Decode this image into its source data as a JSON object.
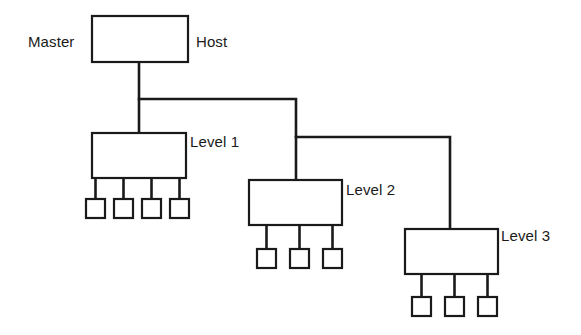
{
  "diagram": {
    "background_color": "#ffffff",
    "line_color": "#1a1a1a",
    "box_fill": "#ffffff",
    "labels": {
      "master": "Master",
      "host": "Host",
      "level1": "Level 1",
      "level2": "Level 2",
      "level3": "Level 3"
    },
    "nodes": [
      {
        "id": "master-host",
        "name": "master-host-box",
        "x": 92,
        "y": 16,
        "width": 96,
        "height": 46,
        "leaf_count": 0
      },
      {
        "id": "level1",
        "name": "level-1-box",
        "x": 92,
        "y": 133,
        "width": 94,
        "height": 45,
        "leaf_count": 4
      },
      {
        "id": "level2",
        "name": "level-2-box",
        "x": 249,
        "y": 180,
        "width": 93,
        "height": 45,
        "leaf_count": 3
      },
      {
        "id": "level3",
        "name": "level-3-box",
        "x": 405,
        "y": 229,
        "width": 93,
        "height": 45,
        "leaf_count": 3
      }
    ],
    "leaf_nodes": [
      {
        "parent": "level1",
        "x": 86,
        "y": 199,
        "size": 19
      },
      {
        "parent": "level1",
        "x": 114,
        "y": 199,
        "size": 19
      },
      {
        "parent": "level1",
        "x": 142,
        "y": 199,
        "size": 19
      },
      {
        "parent": "level1",
        "x": 170,
        "y": 199,
        "size": 19
      },
      {
        "parent": "level2",
        "x": 257,
        "y": 249,
        "size": 19
      },
      {
        "parent": "level2",
        "x": 290,
        "y": 249,
        "size": 19
      },
      {
        "parent": "level2",
        "x": 323,
        "y": 249,
        "size": 19
      },
      {
        "parent": "level3",
        "x": 412,
        "y": 297,
        "size": 19
      },
      {
        "parent": "level3",
        "x": 445,
        "y": 297,
        "size": 19
      },
      {
        "parent": "level3",
        "x": 478,
        "y": 297,
        "size": 19
      }
    ],
    "connections": [
      {
        "name": "host-to-trunk",
        "points": "139,62 139,133"
      },
      {
        "name": "trunk-to-level2",
        "points": "139,99 296,99 296,180"
      },
      {
        "name": "trunk-to-level3",
        "points": "296,137 450,137 450,229"
      },
      {
        "name": "level1-leaf-1",
        "points": "95.5,178 95.5,199"
      },
      {
        "name": "level1-leaf-2",
        "points": "123.5,178 123.5,199"
      },
      {
        "name": "level1-leaf-3",
        "points": "151.5,178 151.5,199"
      },
      {
        "name": "level1-leaf-4",
        "points": "179.5,178 179.5,199"
      },
      {
        "name": "level2-leaf-1",
        "points": "266.5,225 266.5,249"
      },
      {
        "name": "level2-leaf-2",
        "points": "299.5,225 299.5,249"
      },
      {
        "name": "level2-leaf-3",
        "points": "332.5,225 332.5,249"
      },
      {
        "name": "level3-leaf-1",
        "points": "421.5,274 421.5,297"
      },
      {
        "name": "level3-leaf-2",
        "points": "454.5,274 454.5,297"
      },
      {
        "name": "level3-leaf-3",
        "points": "487.5,274 487.5,297"
      }
    ]
  }
}
